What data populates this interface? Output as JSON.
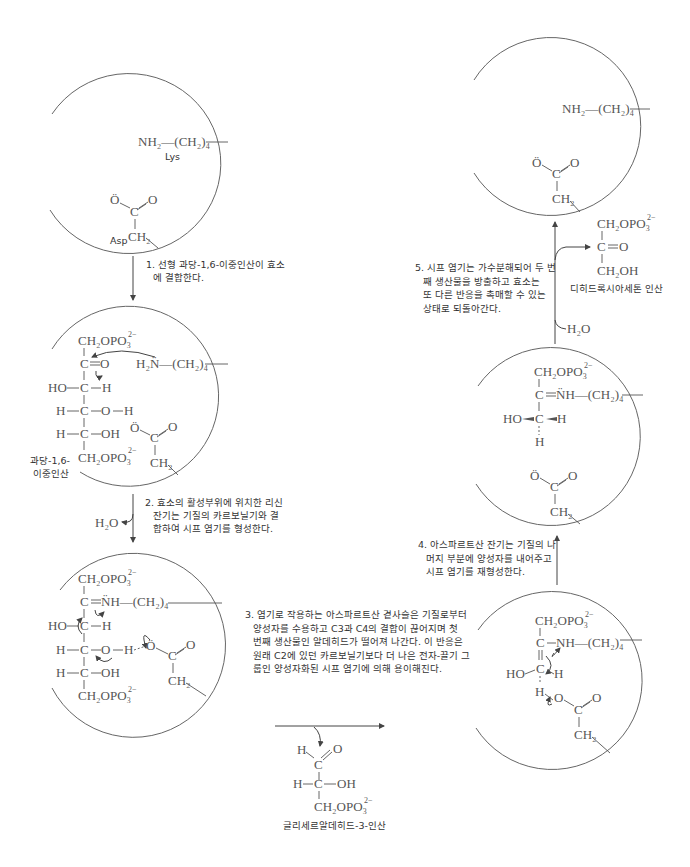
{
  "colors": {
    "line": "#555555",
    "text": "#333333",
    "background": "#ffffff"
  },
  "residues": {
    "lys": "Lys",
    "asp": "Asp"
  },
  "chem": {
    "nh2": "NH₂",
    "h2n": "H₂N̈",
    "ch2_4": "(CH₂)₄",
    "ch2": "CH₂",
    "c": "C",
    "o": "O",
    "o_minus": "Ö",
    "ch2opo3": "CH₂OPO₃",
    "charge": "2−",
    "ho": "HO",
    "h": "H",
    "oh": "OH",
    "nh_plus": "N̈H",
    "ch2oh": "CH₂OH",
    "h2o": "H₂O",
    "dash": "—"
  },
  "labels": {
    "fbp": [
      "과당-1,6-",
      "이중인산"
    ],
    "g3p": "글리세르알데히드-3-인산",
    "dhap": "디히드록시아세톤 인산"
  },
  "steps": [
    {
      "id": 1,
      "lines": [
        "1. 선형 과당-1,6-이중인산이 효소",
        "에 결합한다."
      ]
    },
    {
      "id": 2,
      "lines": [
        "2. 효소의 활성부위에 위치한 리신",
        "잔기는 기질의 카르보닐기와 결",
        "합하여 시프 염기를 형성한다."
      ]
    },
    {
      "id": 3,
      "lines": [
        "3. 염기로 작용하는 아스파르트산 곁사슬은 기질로부터",
        "양성자를 수용하고 C3과 C4의 결합이 끊어지며 첫",
        "번째 생산물인 알데히드가 떨어져 나간다. 이 반응은",
        "원래 C2에 있던 카르보닐기보다 더 나은 전자-끌기 그",
        "룹인 양성자화된 시프 염기에 의해 용이해진다."
      ]
    },
    {
      "id": 4,
      "lines": [
        "4. 아스파르트산 잔기는 기질의 나",
        "머지 부분에 양성자를 내어주고",
        "시프 염기를 재형성한다."
      ]
    },
    {
      "id": 5,
      "lines": [
        "5. 시프 염기는 가수분해되어 두 번",
        "째 생산물을 방출하고 효소는",
        "또 다른 반응을 촉매할 수 있는",
        "상태로 되돌아간다."
      ]
    }
  ]
}
